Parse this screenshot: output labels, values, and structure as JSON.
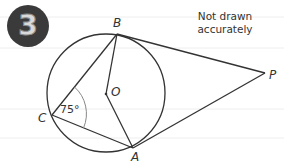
{
  "question": {
    "number": "3"
  },
  "note": {
    "line1": "Not drawn",
    "line2": "accurately"
  },
  "points": {
    "B": {
      "label": "B",
      "x": 117,
      "y": 34
    },
    "O": {
      "label": "O",
      "x": 106,
      "y": 94
    },
    "C": {
      "label": "C",
      "x": 52,
      "y": 115
    },
    "A": {
      "label": "A",
      "x": 133,
      "y": 148
    },
    "P": {
      "label": "P",
      "x": 265,
      "y": 73
    }
  },
  "circle": {
    "center": "O",
    "cx": 106,
    "cy": 93,
    "r": 59
  },
  "angle": {
    "vertex": "C",
    "label": "75°"
  },
  "colors": {
    "line": "#333333",
    "badge": "#3a3a3a",
    "ruled_line": "#eeeeee"
  }
}
